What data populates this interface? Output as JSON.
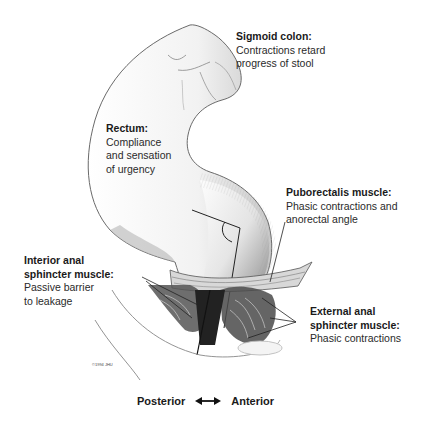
{
  "labels": {
    "sigmoid": {
      "title": "Sigmoid colon:",
      "desc1": "Contractions retard",
      "desc2": "progress of stool"
    },
    "rectum": {
      "title": "Rectum:",
      "desc1": "Compliance",
      "desc2": "and sensation",
      "desc3": "of urgency"
    },
    "puborectalis": {
      "title": "Puborectalis muscle:",
      "desc1": "Phasic contractions and",
      "desc2": "anorectal angle"
    },
    "interior_anal": {
      "title1": "Interior anal",
      "title2": "sphincter muscle:",
      "desc1": "Passive barrier",
      "desc2": "to leakage"
    },
    "external_anal": {
      "title1": "External anal",
      "title2": "sphincter muscle:",
      "desc1": "Phasic contractions"
    }
  },
  "axis": {
    "left": "Posterior",
    "right": "Anterior",
    "arrow_icon": "double-arrow-icon"
  },
  "signature": "©1994 JHU"
}
